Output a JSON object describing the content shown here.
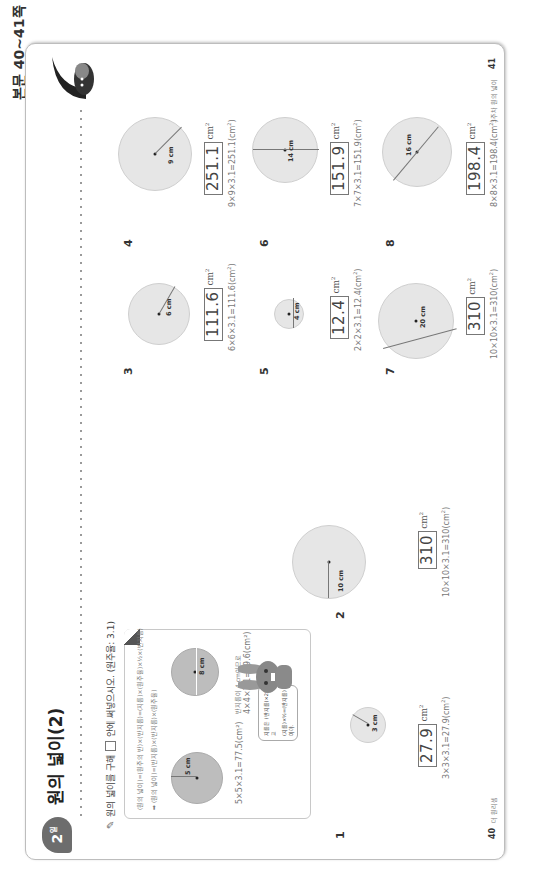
{
  "side_label": "본문 40~41쪽",
  "header": {
    "day_badge": "2",
    "day_suffix": "일",
    "title": "원의 넓이(2)"
  },
  "instruction": {
    "prefix": "원의 넓이를 구해",
    "suffix": "안에 써넣으시오. (원주율: 3.1)"
  },
  "tip_box": {
    "formula_1": "(원의 넓이)=(원주의 반)×(반지름)=(지름)×(원주율)×½×(반지름)",
    "formula_2": "➡ (원의 넓이)=(반지름)×(반지름)×(원주율)",
    "example_1": {
      "radius_label": "5 cm",
      "calc": "5×5×3.1=77.5(cm²)"
    },
    "example_2": {
      "diameter_label": "8 cm",
      "note": "반지름이 4 cm이므로",
      "calc": "4×4×3.1=49.6(cm²)"
    },
    "speech_bubble": {
      "line1": "지름은 (반지름)×2이고",
      "line2": "(지름)×½=(반지름)이야."
    }
  },
  "problems": [
    {
      "number": "1",
      "label": "3 cm",
      "type": "radius",
      "answer": "27.9",
      "unit": "cm",
      "calc": "3×3×3.1=27.9(cm",
      "calc_end": ")"
    },
    {
      "number": "2",
      "label": "10 cm",
      "type": "radius",
      "answer": "310",
      "unit": "cm",
      "calc": "10×10×3.1=310(cm",
      "calc_end": ")"
    },
    {
      "number": "3",
      "label": "6 cm",
      "type": "radius",
      "answer": "111.6",
      "unit": "cm",
      "calc": "6×6×3.1=111.6(cm",
      "calc_end": ")"
    },
    {
      "number": "4",
      "label": "9 cm",
      "type": "radius",
      "answer": "251.1",
      "unit": "cm",
      "calc": "9×9×3.1=251.1(cm",
      "calc_end": ")"
    },
    {
      "number": "5",
      "label": "4 cm",
      "type": "diameter",
      "answer": "12.4",
      "unit": "cm",
      "calc": "2×2×3.1=12.4(cm",
      "calc_end": ")"
    },
    {
      "number": "6",
      "label": "14 cm",
      "type": "diameter",
      "answer": "151.9",
      "unit": "cm",
      "calc": "7×7×3.1=151.9(cm",
      "calc_end": ")"
    },
    {
      "number": "7",
      "label": "20 cm",
      "type": "diameter",
      "answer": "310",
      "unit": "cm",
      "calc": "10×10×3.1=310(cm",
      "calc_end": ")"
    },
    {
      "number": "8",
      "label": "16 cm",
      "type": "diameter",
      "answer": "198.4",
      "unit": "cm",
      "calc": "8×8×3.1=198.4(cm",
      "calc_end": ")"
    }
  ],
  "footer": {
    "left_page": "40",
    "left_text": "더 원리셈",
    "right_page": "41",
    "right_text": "3주차 원의 넓이"
  }
}
